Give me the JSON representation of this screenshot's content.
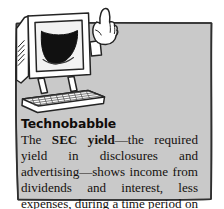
{
  "figure": {
    "kind": "book-sidebar-callout",
    "heading": "Technobabble",
    "body_segments": [
      {
        "text": "The ",
        "bold": false
      },
      {
        "text": "SEC yield",
        "bold": true
      },
      {
        "text": "—the required yield in disclosures and advertising—shows income from dividends and interest, less expenses, during a time period on a per-share basis.",
        "bold": false
      }
    ],
    "body_text_plain": "The SEC yield—the required yield in disclosures and advertising—shows income from dividends and interest, less expenses, during a time period on a per-share basis.",
    "line_breaks_as_printed": [
      "Technobabble",
      "The SEC",
      "yield—the",
      "required yield",
      "in disclosures",
      "and advertising—shows",
      "income from dividends and",
      "interest, less expenses, during",
      "a time period on a per-share",
      "basis."
    ],
    "illustration": {
      "name": "smiling-computer-pointing",
      "parts": [
        "monitor",
        "screen-smile",
        "arm",
        "pointing-hand",
        "keyboard"
      ]
    },
    "colors": {
      "panel_fill": "#c9c9c9",
      "panel_border": "#3a3a3a",
      "text": "#15110f",
      "page_background": "#ffffff",
      "ink": "#2b2b2b",
      "screen_smile": "#111111"
    }
  }
}
